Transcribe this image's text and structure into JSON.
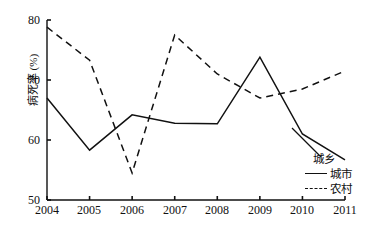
{
  "chart_data": {
    "type": "line",
    "title": "",
    "xlabel": "",
    "ylabel": "病死率 (%)",
    "categories": [
      "2004",
      "2005",
      "2006",
      "2007",
      "2008",
      "2009",
      "2010",
      "2011"
    ],
    "x": [
      2004,
      2005,
      2006,
      2007,
      2008,
      2009,
      2010,
      2011
    ],
    "xlim": [
      2004,
      2011
    ],
    "ylim": [
      50,
      80
    ],
    "yticks": [
      50,
      60,
      70,
      80
    ],
    "grid": false,
    "legend_position": "right",
    "legend_title": "城乡",
    "series": [
      {
        "name": "城市",
        "style": "solid",
        "color": "#111111",
        "values": [
          67.0,
          58.3,
          64.2,
          62.8,
          62.7,
          73.8,
          61.0,
          56.7
        ]
      },
      {
        "name": "农村",
        "style": "dashed",
        "color": "#111111",
        "values": [
          78.8,
          73.3,
          54.5,
          77.5,
          71.0,
          67.0,
          68.5,
          71.5
        ]
      }
    ]
  },
  "axis": {
    "y_label": "病死率 (%)",
    "y_ticks": [
      "80",
      "70",
      "60",
      "50"
    ],
    "x_ticks": [
      "2004",
      "2005",
      "2006",
      "2007",
      "2008",
      "2009",
      "2010",
      "2011"
    ]
  },
  "legend": {
    "title": "城乡",
    "items": [
      {
        "label": "城市",
        "style": "solid"
      },
      {
        "label": "农村",
        "style": "dashed"
      }
    ]
  }
}
